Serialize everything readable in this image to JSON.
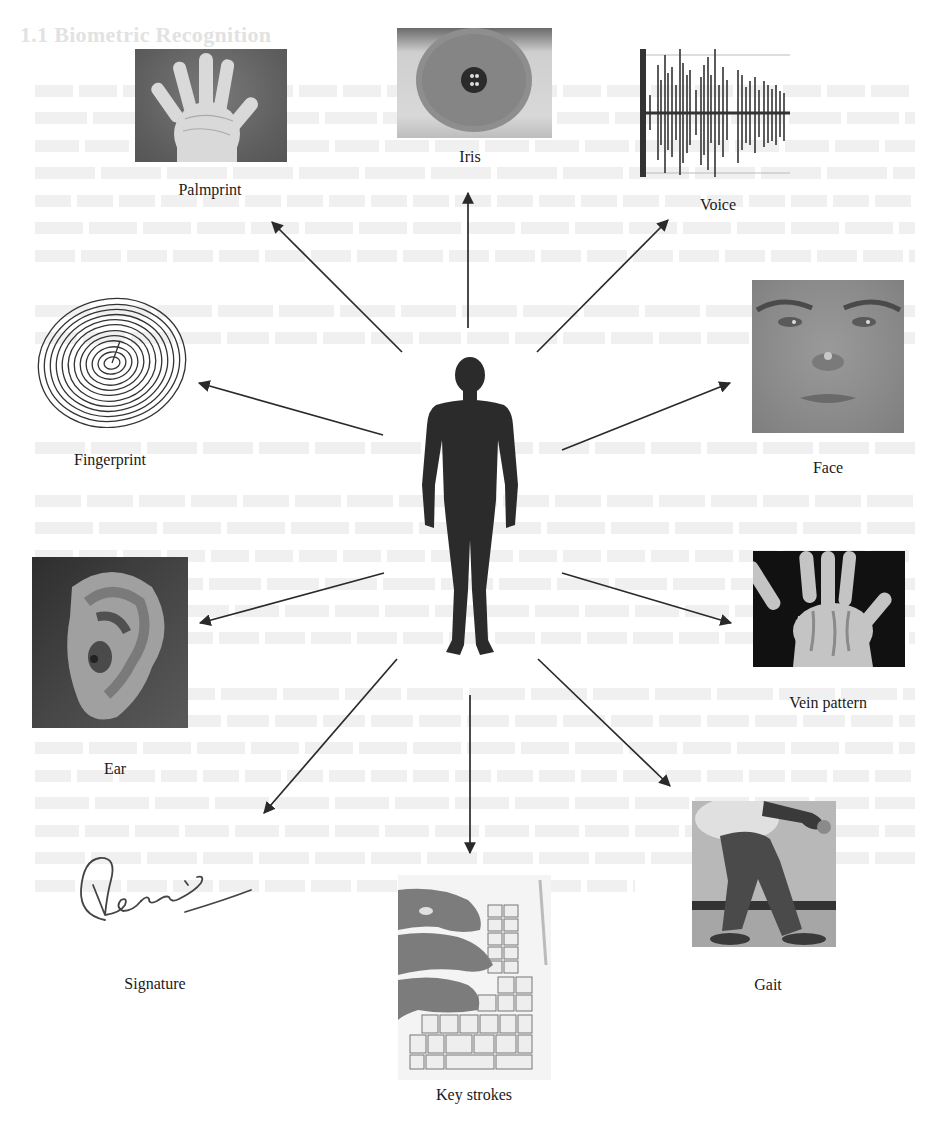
{
  "figure": {
    "type": "biometric-modalities-diagram",
    "center": {
      "name": "human-silhouette",
      "description": "Human body silhouette"
    },
    "modalities": [
      {
        "id": "palmprint",
        "label": "Palmprint"
      },
      {
        "id": "iris",
        "label": "Iris"
      },
      {
        "id": "voice",
        "label": "Voice"
      },
      {
        "id": "fingerprint",
        "label": "Fingerprint"
      },
      {
        "id": "face",
        "label": "Face"
      },
      {
        "id": "ear",
        "label": "Ear"
      },
      {
        "id": "vein",
        "label": "Vein pattern"
      },
      {
        "id": "signature",
        "label": "Signature"
      },
      {
        "id": "keystrokes",
        "label": "Key strokes"
      },
      {
        "id": "gait",
        "label": "Gait"
      }
    ],
    "colors": {
      "arrow": "#2a2a2a",
      "silhouette": "#2b2b2b",
      "background": "#ffffff",
      "ghost_text": "#e6e6e6"
    }
  },
  "background_bleedthrough": {
    "heading": "1.1  Biometric Recognition"
  }
}
